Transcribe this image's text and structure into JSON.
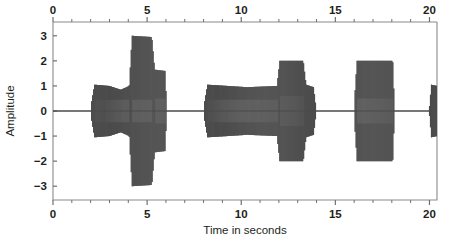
{
  "chart_data": {
    "type": "line",
    "title": "",
    "subtitle": "",
    "xlabel": "Time in seconds",
    "ylabel": "Amplitude",
    "xlim": [
      0,
      20.4
    ],
    "ylim": [
      -3.55,
      3.55
    ],
    "grid": false,
    "legend": null,
    "x_ticks_bottom": [
      0,
      5,
      10,
      15,
      20
    ],
    "x_tick_labels_bottom": [
      "0",
      "5",
      "10",
      "15",
      "20"
    ],
    "x_ticks_top": [
      0,
      5,
      10,
      15,
      20
    ],
    "x_tick_labels_top": [
      "0",
      "5",
      "10",
      "15",
      "20"
    ],
    "x_minor_tick_step": 1,
    "y_ticks": [
      3,
      2,
      1,
      0,
      -1,
      -2,
      -3
    ],
    "y_tick_labels": [
      "3",
      "2",
      "1",
      "0",
      "−1",
      "−2",
      "−3"
    ],
    "top_axis": true,
    "bottom_axis": true,
    "series_name": "speech waveform",
    "carrier_frequency_hz": 9.5,
    "envelope_note": "Amplitude envelope of an oscillating audio/speech signal; silent between bursts.",
    "segments": [
      {
        "t_start": 0.0,
        "t_end": 2.0,
        "amp_start": 0.0,
        "amp_end": 0.0,
        "label": "silence"
      },
      {
        "t_start": 2.0,
        "t_end": 2.2,
        "amp_start": 0.15,
        "amp_end": 1.05,
        "label": "burst-1-onset"
      },
      {
        "t_start": 2.2,
        "t_end": 3.0,
        "amp_start": 1.05,
        "amp_end": 1.0,
        "label": "burst-1-a"
      },
      {
        "t_start": 3.0,
        "t_end": 3.6,
        "amp_start": 1.0,
        "amp_end": 0.85,
        "label": "burst-1-b"
      },
      {
        "t_start": 3.6,
        "t_end": 4.05,
        "amp_start": 0.85,
        "amp_end": 1.0,
        "label": "burst-1-c"
      },
      {
        "t_start": 4.05,
        "t_end": 4.2,
        "amp_start": 1.0,
        "amp_end": 3.0,
        "label": "burst-2-onset"
      },
      {
        "t_start": 4.2,
        "t_end": 5.25,
        "amp_start": 3.0,
        "amp_end": 2.95,
        "label": "burst-2-loud"
      },
      {
        "t_start": 5.25,
        "t_end": 5.4,
        "amp_start": 2.95,
        "amp_end": 1.65,
        "label": "burst-2-decay"
      },
      {
        "t_start": 5.4,
        "t_end": 5.95,
        "amp_start": 1.65,
        "amp_end": 1.6,
        "label": "burst-2-tail"
      },
      {
        "t_start": 5.95,
        "t_end": 6.05,
        "amp_start": 1.6,
        "amp_end": 0.0,
        "label": "burst-2-offset"
      },
      {
        "t_start": 6.05,
        "t_end": 8.0,
        "amp_start": 0.0,
        "amp_end": 0.0,
        "label": "silence"
      },
      {
        "t_start": 8.0,
        "t_end": 8.2,
        "amp_start": 0.15,
        "amp_end": 1.05,
        "label": "burst-3-onset"
      },
      {
        "t_start": 8.2,
        "t_end": 9.3,
        "amp_start": 1.05,
        "amp_end": 1.0,
        "label": "burst-3-a"
      },
      {
        "t_start": 9.3,
        "t_end": 10.3,
        "amp_start": 1.0,
        "amp_end": 0.95,
        "label": "burst-3-b"
      },
      {
        "t_start": 10.3,
        "t_end": 11.9,
        "amp_start": 0.95,
        "amp_end": 1.0,
        "label": "burst-3-c"
      },
      {
        "t_start": 11.9,
        "t_end": 12.05,
        "amp_start": 1.0,
        "amp_end": 2.0,
        "label": "burst-4-onset"
      },
      {
        "t_start": 12.05,
        "t_end": 13.3,
        "amp_start": 2.0,
        "amp_end": 2.0,
        "label": "burst-4-loud"
      },
      {
        "t_start": 13.3,
        "t_end": 13.45,
        "amp_start": 2.0,
        "amp_end": 1.05,
        "label": "burst-4-decay"
      },
      {
        "t_start": 13.45,
        "t_end": 13.85,
        "amp_start": 1.05,
        "amp_end": 0.95,
        "label": "burst-4-tail"
      },
      {
        "t_start": 13.85,
        "t_end": 14.0,
        "amp_start": 0.95,
        "amp_end": 0.0,
        "label": "burst-4-offset"
      },
      {
        "t_start": 14.0,
        "t_end": 16.0,
        "amp_start": 0.0,
        "amp_end": 0.0,
        "label": "silence"
      },
      {
        "t_start": 16.0,
        "t_end": 16.15,
        "amp_start": 0.2,
        "amp_end": 2.0,
        "label": "burst-5-onset"
      },
      {
        "t_start": 16.15,
        "t_end": 18.05,
        "amp_start": 2.0,
        "amp_end": 2.0,
        "label": "burst-5-loud"
      },
      {
        "t_start": 18.05,
        "t_end": 18.15,
        "amp_start": 2.0,
        "amp_end": 0.0,
        "label": "burst-5-offset"
      },
      {
        "t_start": 18.15,
        "t_end": 20.0,
        "amp_start": 0.0,
        "amp_end": 0.0,
        "label": "silence"
      },
      {
        "t_start": 20.0,
        "t_end": 20.1,
        "amp_start": 0.2,
        "amp_end": 1.05,
        "label": "burst-6-onset"
      },
      {
        "t_start": 20.1,
        "t_end": 20.4,
        "amp_start": 1.05,
        "amp_end": 1.0,
        "label": "burst-6-clipped"
      }
    ],
    "inner_band": [
      {
        "t_start": 2.2,
        "t_end": 4.05,
        "amp": 0.45
      },
      {
        "t_start": 4.2,
        "t_end": 5.25,
        "amp": 0.45
      },
      {
        "t_start": 5.4,
        "t_end": 5.95,
        "amp": 0.5
      },
      {
        "t_start": 8.2,
        "t_end": 11.9,
        "amp": 0.45
      },
      {
        "t_start": 12.05,
        "t_end": 13.3,
        "amp": 0.6
      },
      {
        "t_start": 16.15,
        "t_end": 18.05,
        "amp": 0.5
      }
    ]
  },
  "colors": {
    "waveform": "#4c4c4c",
    "axis": "#8a8a8a",
    "text": "#231f20",
    "background": "#ffffff"
  }
}
